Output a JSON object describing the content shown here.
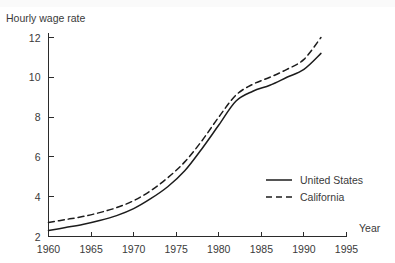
{
  "chart_data": {
    "type": "line",
    "title": "",
    "ylabel": "Hourly wage rate",
    "xlabel": "Year",
    "xlim": [
      1960,
      1995
    ],
    "ylim": [
      2,
      12
    ],
    "grid": false,
    "legend_position": "center-right",
    "xticks": [
      "1960",
      "1965",
      "1970",
      "1975",
      "1980",
      "1985",
      "1990",
      "1995"
    ],
    "xtick_values": [
      1960,
      1965,
      1970,
      1975,
      1980,
      1985,
      1990,
      1995
    ],
    "yticks": [
      "2",
      "4",
      "6",
      "8",
      "10",
      "12"
    ],
    "ytick_values": [
      2,
      4,
      6,
      8,
      10,
      12
    ],
    "x": [
      1960,
      1962,
      1964,
      1966,
      1968,
      1970,
      1972,
      1974,
      1976,
      1978,
      1980,
      1982,
      1984,
      1986,
      1988,
      1990,
      1992
    ],
    "series": [
      {
        "name": "United States",
        "style": "solid",
        "color": "#1c1c1c",
        "values": [
          2.3,
          2.45,
          2.6,
          2.8,
          3.05,
          3.4,
          3.9,
          4.5,
          5.3,
          6.4,
          7.6,
          8.8,
          9.3,
          9.6,
          10.0,
          10.4,
          11.2
        ]
      },
      {
        "name": "California",
        "style": "dashed",
        "color": "#1c1c1c",
        "values": [
          2.7,
          2.85,
          3.0,
          3.2,
          3.45,
          3.8,
          4.3,
          4.95,
          5.75,
          6.8,
          8.0,
          9.1,
          9.65,
          10.0,
          10.4,
          10.9,
          12.0
        ]
      }
    ]
  },
  "legend": {
    "items": [
      {
        "label": "United States"
      },
      {
        "label": "California"
      }
    ]
  }
}
